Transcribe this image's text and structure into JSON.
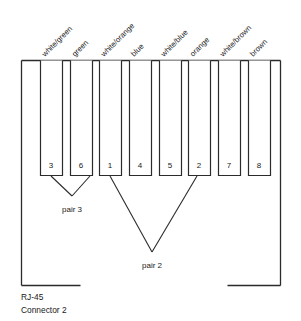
{
  "diagram": {
    "caption": {
      "line1": "RJ-45",
      "line2": "Connector 2"
    },
    "stroke_color": "#2b2b2b",
    "background_color": "#ffffff",
    "pins": [
      {
        "number": "3",
        "wire": "white/green",
        "x": 40,
        "width": 22
      },
      {
        "number": "6",
        "wire": "green",
        "x": 70,
        "width": 22
      },
      {
        "number": "1",
        "wire": "white/orange",
        "x": 99,
        "width": 22
      },
      {
        "number": "4",
        "wire": "blue",
        "x": 129,
        "width": 22
      },
      {
        "number": "5",
        "wire": "white/blue",
        "x": 159,
        "width": 22
      },
      {
        "number": "2",
        "wire": "orange",
        "x": 188,
        "width": 22
      },
      {
        "number": "7",
        "wire": "white/brown",
        "x": 218,
        "width": 22
      },
      {
        "number": "8",
        "wire": "brown",
        "x": 248,
        "width": 22
      }
    ],
    "pairs": [
      {
        "label": "pair 3",
        "pins": [
          "3",
          "6"
        ],
        "vertex_x": 72,
        "vertex_y": 196,
        "label_x": 72,
        "label_y": 209
      },
      {
        "label": "pair 2",
        "pins": [
          "1",
          "2"
        ],
        "vertex_x": 152,
        "vertex_y": 252,
        "label_x": 152,
        "label_y": 265
      }
    ],
    "geometry": {
      "frame_left": 21,
      "frame_right": 281,
      "frame_top": 60,
      "frame_bottom": 285,
      "pin_top": 60,
      "pin_bottom": 176,
      "notch_left": 80,
      "notch_right": 227,
      "label_angle": -45
    }
  }
}
